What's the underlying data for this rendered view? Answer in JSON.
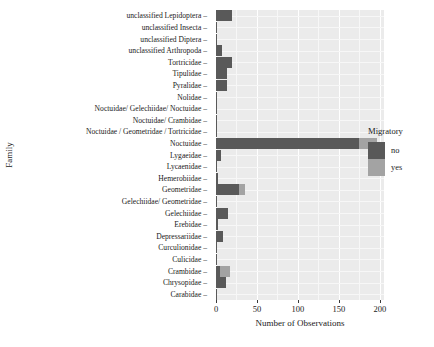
{
  "chart_data": {
    "type": "bar",
    "orientation": "horizontal",
    "stacked": true,
    "title": "",
    "xlabel": "Number of Observations",
    "ylabel": "Family",
    "xlim": [
      0,
      205
    ],
    "xticks": [
      0,
      50,
      100,
      150,
      200
    ],
    "xtick_labels": [
      "0",
      "50",
      "100",
      "150",
      "200"
    ],
    "grid": true,
    "legend": {
      "title": "Migratory",
      "position": "right",
      "entries": [
        {
          "label": "no",
          "color": "#595959"
        },
        {
          "label": "yes",
          "color": "#a3a3a3"
        }
      ]
    },
    "categories": [
      "unclassified Lepidoptera",
      "unclassified Insecta",
      "unclassified Diptera",
      "unclassified Arthropoda",
      "Tortricidae",
      "Tipulidae",
      "Pyralidae",
      "Nolidae",
      "Noctuidae/ Gelechiidae/ Noctuidae",
      "Noctuidae/ Crambidae",
      "Noctuidae / Geometridae / Tortricidae",
      "Noctuidae",
      "Lygaeidae",
      "Lycaenidae",
      "Hemerobiidae",
      "Geometridae",
      "Gelechiidae/ Geometridae",
      "Gelechiidae",
      "Erebidae",
      "Depressariidae",
      "Curculionidae",
      "Culicidae",
      "Crambidae",
      "Chrysopidae",
      "Carabidae"
    ],
    "series": [
      {
        "name": "no",
        "color": "#595959",
        "values": [
          20,
          1,
          1,
          7,
          19,
          14,
          13,
          1,
          1,
          1,
          1,
          174,
          6,
          1,
          3,
          28,
          1,
          15,
          2,
          9,
          1,
          1,
          5,
          12,
          1
        ]
      },
      {
        "name": "yes",
        "color": "#a3a3a3",
        "values": [
          0,
          0,
          0,
          0,
          0,
          0,
          0,
          0,
          0,
          0,
          0,
          22,
          0,
          0,
          0,
          8,
          0,
          0,
          0,
          0,
          0,
          0,
          12,
          0,
          0
        ]
      }
    ],
    "totals": [
      20,
      1,
      1,
      7,
      19,
      14,
      13,
      1,
      1,
      1,
      1,
      196,
      6,
      1,
      3,
      36,
      1,
      15,
      2,
      9,
      1,
      1,
      17,
      12,
      1
    ]
  },
  "theme": {
    "panel_background": "#ebebeb",
    "gridline_major": "#ffffff",
    "gridline_minor": "#f7f7f7",
    "text_color": "#1a1a1a",
    "page_background": "#ffffff"
  }
}
